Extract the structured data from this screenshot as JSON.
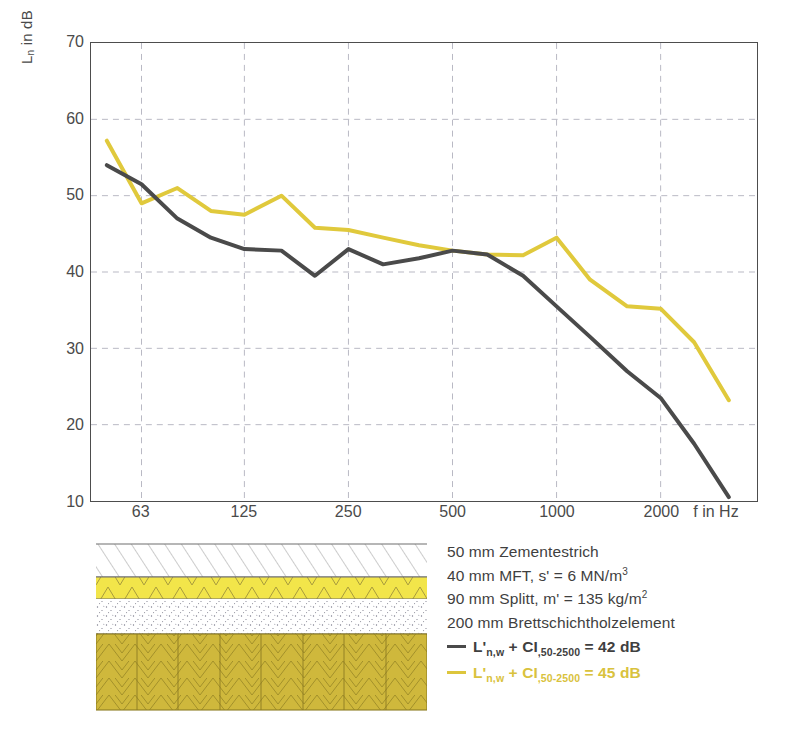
{
  "chart_data": {
    "type": "line",
    "title": "",
    "xlabel": "f in Hz",
    "ylabel": "Ln in dB",
    "ylim": [
      10,
      70
    ],
    "ytick_values": [
      70,
      60,
      50,
      40,
      30,
      20,
      10
    ],
    "xtick_labels": [
      "63",
      "125",
      "250",
      "500",
      "1000",
      "2000"
    ],
    "xtick_freqs": [
      63,
      125,
      250,
      500,
      1000,
      2000
    ],
    "x_axis_scale": "log",
    "xlim": [
      45,
      3800
    ],
    "grid": "dashed",
    "legend_position": "below-figure",
    "x": [
      50,
      63,
      80,
      100,
      125,
      160,
      200,
      250,
      315,
      400,
      500,
      630,
      800,
      1000,
      1250,
      1600,
      2000,
      2500,
      3150
    ],
    "series": [
      {
        "name": "L'n,w + CI,50-2500 = 42 dB",
        "color": "#4a4a4a",
        "values": [
          54.0,
          51.5,
          47.0,
          44.5,
          43.0,
          42.8,
          39.5,
          43.0,
          41.0,
          41.8,
          42.8,
          42.3,
          39.5,
          35.5,
          31.5,
          27.0,
          23.5,
          17.5,
          10.5
        ]
      },
      {
        "name": "L'n,w + CI,50-2500 = 45 dB",
        "color": "#e0c93c",
        "values": [
          57.2,
          49.0,
          51.0,
          48.0,
          47.5,
          50.0,
          45.8,
          45.5,
          44.5,
          43.5,
          42.8,
          42.3,
          42.2,
          44.5,
          39.0,
          35.5,
          35.2,
          30.8,
          23.2
        ]
      }
    ]
  },
  "axes": {
    "ylabel_main": "L",
    "ylabel_sub": "n",
    "ylabel_tail": " in dB",
    "xlabel": "f in Hz"
  },
  "construction": {
    "layers": [
      {
        "name": "screed-layer",
        "label": "50 mm Zementestrich",
        "fill": "#ffffff",
        "pattern": "diagonal-hatch"
      },
      {
        "name": "impact-insulation",
        "label": "40 mm MFT",
        "fill": "#f2e54a",
        "pattern": "triangle-zigzag"
      },
      {
        "name": "gravel-fill",
        "label": "90 mm Splitt",
        "fill": "#ffffff",
        "pattern": "stipple"
      },
      {
        "name": "glulam-element",
        "label": "200 mm Brettschichtholzelement",
        "fill": "#cfb83c",
        "pattern": "herringbone"
      }
    ]
  },
  "legend": {
    "lines": [
      {
        "id": "l1",
        "text": "50 mm Zementestrich",
        "key": "none"
      },
      {
        "id": "l2",
        "text": "40 mm MFT, s' = 6 MN/m",
        "sup": "3",
        "key": "none"
      },
      {
        "id": "l3",
        "text": "90 mm Splitt, m' = 135 kg/m",
        "sup": "2",
        "key": "none"
      },
      {
        "id": "l4",
        "text": "200 mm Brettschichtholzelement",
        "key": "none"
      },
      {
        "id": "l5",
        "pre": "L'",
        "sub1": "n,w",
        "mid": " + CI",
        "sub2": ",50-2500",
        "post": " = 42 dB",
        "key": "#4a4a4a"
      },
      {
        "id": "l6",
        "pre": "L'",
        "sub1": "n,w",
        "mid": " + CI",
        "sub2": ",50-2500",
        "post": " = 45 dB",
        "key": "#ddc63c"
      }
    ]
  },
  "colors": {
    "dark_curve": "#4a4a4a",
    "yellow_curve": "#e0c93c",
    "insulation": "#f2e54a",
    "timber": "#cfb83c",
    "frame": "#4d4d4d",
    "grid": "#b9b9c4"
  }
}
